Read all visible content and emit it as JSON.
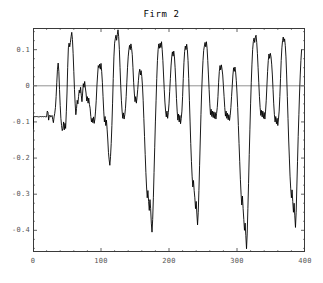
{
  "chart_data": {
    "type": "line",
    "title": "Firm 2",
    "xlabel": "",
    "ylabel": "",
    "xlim": [
      0,
      400
    ],
    "ylim": [
      -0.46,
      0.16
    ],
    "grid": false,
    "legend": null,
    "zero_line": 0,
    "line_color": "#000000",
    "frame_color": "#3a3a3a",
    "zero_line_color": "#777777",
    "tick_label_color": "#555555",
    "background": "#ffffff",
    "yticks": [
      0.1,
      0,
      -0.1,
      -0.2,
      -0.3,
      -0.4
    ],
    "ytick_labels": [
      "0.1",
      "0",
      "-0.1",
      "-0.2",
      "-0.3",
      "-0.4"
    ],
    "xticks": [
      0,
      100,
      200,
      300,
      400
    ],
    "xtick_labels": [
      "0",
      "100",
      "200",
      "300",
      "400"
    ],
    "n_points": 400,
    "series_name": "Firm 2",
    "summary": {
      "max": 0.152,
      "min": -0.451,
      "start_value": -0.12,
      "plateau_value": -0.085,
      "cycle_period": 36
    },
    "x": [
      0,
      1,
      2,
      3,
      4,
      5,
      6,
      7,
      8,
      9,
      10,
      11,
      12,
      13,
      14,
      15,
      16,
      17,
      18,
      19,
      20,
      21,
      22,
      23,
      24,
      25,
      26,
      27,
      28,
      29,
      30,
      31,
      32,
      33,
      34,
      35,
      36,
      37,
      38,
      39,
      40,
      41,
      42,
      43,
      44,
      45,
      46,
      47,
      48,
      49,
      50,
      51,
      52,
      53,
      54,
      55,
      56,
      57,
      58,
      59,
      60,
      61,
      62,
      63,
      64,
      65,
      66,
      67,
      68,
      69,
      70,
      71,
      72,
      73,
      74,
      75,
      76,
      77,
      78,
      79,
      80,
      81,
      82,
      83,
      84,
      85,
      86,
      87,
      88,
      89,
      90,
      91,
      92,
      93,
      94,
      95,
      96,
      97,
      98,
      99,
      100,
      101,
      102,
      103,
      104,
      105,
      106,
      107,
      108,
      109,
      110,
      111,
      112,
      113,
      114,
      115,
      116,
      117,
      118,
      119,
      120,
      121,
      122,
      123,
      124,
      125,
      126,
      127,
      128,
      129,
      130,
      131,
      132,
      133,
      134,
      135,
      136,
      137,
      138,
      139,
      140,
      141,
      142,
      143,
      144,
      145,
      146,
      147,
      148,
      149,
      150,
      151,
      152,
      153,
      154,
      155,
      156,
      157,
      158,
      159,
      160,
      161,
      162,
      163,
      164,
      165,
      166,
      167,
      168,
      169,
      170,
      171,
      172,
      173,
      174,
      175,
      176,
      177,
      178,
      179,
      180,
      181,
      182,
      183,
      184,
      185,
      186,
      187,
      188,
      189,
      190,
      191,
      192,
      193,
      194,
      195,
      196,
      197,
      198,
      199,
      200,
      201,
      202,
      203,
      204,
      205,
      206,
      207,
      208,
      209,
      210,
      211,
      212,
      213,
      214,
      215,
      216,
      217,
      218,
      219,
      220,
      221,
      222,
      223,
      224,
      225,
      226,
      227,
      228,
      229,
      230,
      231,
      232,
      233,
      234,
      235,
      236,
      237,
      238,
      239,
      240,
      241,
      242,
      243,
      244,
      245,
      246,
      247,
      248,
      249,
      250,
      251,
      252,
      253,
      254,
      255,
      256,
      257,
      258,
      259,
      260,
      261,
      262,
      263,
      264,
      265,
      266,
      267,
      268,
      269,
      270,
      271,
      272,
      273,
      274,
      275,
      276,
      277,
      278,
      279,
      280,
      281,
      282,
      283,
      284,
      285,
      286,
      287,
      288,
      289,
      290,
      291,
      292,
      293,
      294,
      295,
      296,
      297,
      298,
      299,
      300,
      301,
      302,
      303,
      304,
      305,
      306,
      307,
      308,
      309,
      310,
      311,
      312,
      313,
      314,
      315,
      316,
      317,
      318,
      319,
      320,
      321,
      322,
      323,
      324,
      325,
      326,
      327,
      328,
      329,
      330,
      331,
      332,
      333,
      334,
      335,
      336,
      337,
      338,
      339,
      340,
      341,
      342,
      343,
      344,
      345,
      346,
      347,
      348,
      349,
      350,
      351,
      352,
      353,
      354,
      355,
      356,
      357,
      358,
      359,
      360,
      361,
      362,
      363,
      364,
      365,
      366,
      367,
      368,
      369,
      370,
      371,
      372,
      373,
      374,
      375,
      376,
      377,
      378,
      379,
      380,
      381,
      382,
      383,
      384,
      385,
      386,
      387,
      388,
      389,
      390,
      391,
      392,
      393,
      394,
      395
    ],
    "y": [
      -0.12,
      -0.086,
      -0.085,
      -0.086,
      -0.085,
      -0.085,
      -0.086,
      -0.085,
      -0.086,
      -0.085,
      -0.086,
      -0.085,
      -0.085,
      -0.086,
      -0.085,
      -0.086,
      -0.085,
      -0.085,
      -0.086,
      -0.085,
      -0.086,
      -0.07,
      -0.073,
      -0.095,
      -0.083,
      -0.081,
      -0.086,
      -0.085,
      -0.082,
      -0.093,
      -0.102,
      -0.086,
      -0.076,
      -0.06,
      -0.03,
      0.01,
      0.046,
      0.063,
      0.04,
      -0.01,
      -0.055,
      -0.09,
      -0.11,
      -0.124,
      -0.118,
      -0.1,
      -0.122,
      -0.104,
      -0.118,
      -0.072,
      -0.02,
      0.05,
      0.105,
      0.118,
      0.108,
      0.12,
      0.136,
      0.148,
      0.128,
      0.09,
      0.04,
      -0.01,
      -0.05,
      -0.08,
      -0.063,
      -0.04,
      -0.05,
      -0.03,
      -0.012,
      -0.02,
      -0.004,
      -0.026,
      -0.044,
      -0.02,
      0.006,
      -0.004,
      0.012,
      -0.006,
      -0.02,
      -0.042,
      -0.03,
      -0.048,
      -0.034,
      -0.052,
      -0.062,
      -0.085,
      -0.1,
      -0.09,
      -0.102,
      -0.086,
      -0.104,
      -0.092,
      -0.07,
      -0.04,
      0.0,
      0.03,
      0.056,
      0.05,
      0.06,
      0.046,
      0.062,
      0.04,
      0.01,
      -0.03,
      -0.07,
      -0.1,
      -0.085,
      -0.11,
      -0.095,
      -0.12,
      -0.15,
      -0.185,
      -0.205,
      -0.22,
      -0.196,
      -0.16,
      -0.11,
      -0.05,
      0.02,
      0.08,
      0.118,
      0.13,
      0.14,
      0.126,
      0.142,
      0.155,
      0.136,
      0.1,
      0.05,
      0.0,
      -0.04,
      -0.07,
      -0.09,
      -0.075,
      -0.092,
      -0.08,
      -0.062,
      -0.03,
      0.01,
      0.05,
      0.08,
      0.1,
      0.112,
      0.1,
      0.116,
      0.104,
      0.086,
      0.05,
      0.01,
      -0.02,
      -0.044,
      -0.03,
      -0.048,
      -0.032,
      -0.01,
      0.014,
      0.036,
      0.046,
      0.03,
      0.042,
      0.026,
      0.0,
      -0.04,
      -0.09,
      -0.14,
      -0.19,
      -0.24,
      -0.28,
      -0.31,
      -0.29,
      -0.32,
      -0.345,
      -0.315,
      -0.34,
      -0.38,
      -0.405,
      -0.37,
      -0.31,
      -0.24,
      -0.17,
      -0.1,
      -0.04,
      0.02,
      0.07,
      0.1,
      0.116,
      0.104,
      0.118,
      0.106,
      0.122,
      0.1,
      0.07,
      0.03,
      -0.01,
      -0.045,
      -0.07,
      -0.086,
      -0.07,
      -0.09,
      -0.074,
      -0.05,
      -0.015,
      0.02,
      0.055,
      0.08,
      0.094,
      0.082,
      0.096,
      0.08,
      0.05,
      0.01,
      -0.035,
      -0.07,
      -0.095,
      -0.078,
      -0.1,
      -0.082,
      -0.105,
      -0.09,
      -0.07,
      -0.03,
      0.02,
      0.065,
      0.095,
      0.11,
      0.1,
      0.115,
      0.1,
      0.07,
      0.02,
      -0.04,
      -0.1,
      -0.16,
      -0.21,
      -0.25,
      -0.28,
      -0.262,
      -0.29,
      -0.31,
      -0.34,
      -0.32,
      -0.355,
      -0.385,
      -0.35,
      -0.29,
      -0.22,
      -0.15,
      -0.08,
      -0.02,
      0.03,
      0.07,
      0.098,
      0.11,
      0.12,
      0.108,
      0.122,
      0.104,
      0.07,
      0.03,
      -0.01,
      -0.05,
      -0.08,
      -0.065,
      -0.085,
      -0.07,
      -0.088,
      -0.072,
      -0.09,
      -0.074,
      -0.092,
      -0.076,
      -0.06,
      -0.03,
      0.01,
      0.04,
      0.056,
      0.044,
      0.058,
      0.046,
      0.03,
      0.0,
      -0.03,
      -0.06,
      -0.084,
      -0.07,
      -0.09,
      -0.076,
      -0.094,
      -0.08,
      -0.096,
      -0.082,
      -0.06,
      -0.03,
      0.0,
      0.03,
      0.05,
      0.04,
      0.052,
      0.038,
      0.014,
      -0.02,
      -0.06,
      -0.11,
      -0.16,
      -0.21,
      -0.26,
      -0.3,
      -0.33,
      -0.305,
      -0.34,
      -0.37,
      -0.4,
      -0.38,
      -0.415,
      -0.451,
      -0.41,
      -0.34,
      -0.27,
      -0.19,
      -0.12,
      -0.05,
      0.01,
      0.06,
      0.1,
      0.122,
      0.132,
      0.12,
      0.135,
      0.14,
      0.12,
      0.09,
      0.05,
      0.01,
      -0.03,
      -0.06,
      -0.082,
      -0.068,
      -0.086,
      -0.07,
      -0.09,
      -0.074,
      -0.092,
      -0.07,
      -0.04,
      0.0,
      0.04,
      0.07,
      0.088,
      0.076,
      0.09,
      0.08,
      0.06,
      0.03,
      -0.01,
      -0.05,
      -0.08,
      -0.1,
      -0.085,
      -0.105,
      -0.09,
      -0.11,
      -0.092,
      -0.07,
      -0.03,
      0.02,
      0.07,
      0.105,
      0.125,
      0.135,
      0.122,
      0.13,
      0.112,
      0.08,
      0.03,
      -0.03,
      -0.09,
      -0.15,
      -0.2,
      -0.25,
      -0.285,
      -0.31,
      -0.288,
      -0.32,
      -0.35,
      -0.325,
      -0.36,
      -0.392,
      -0.35,
      -0.28,
      -0.21,
      -0.14,
      -0.08,
      -0.02,
      0.03,
      0.07,
      0.1,
      0.125,
      0.14,
      0.148,
      0.13,
      0.11,
      0.08,
      0.04,
      0.0,
      -0.04,
      -0.075,
      -0.1,
      -0.085,
      -0.108,
      -0.09,
      -0.112,
      -0.095,
      -0.115,
      -0.128,
      -0.11,
      -0.13,
      -0.145,
      -0.12,
      -0.08,
      -0.04,
      0.0,
      0.03,
      0.055,
      0.066,
      0.058,
      0.064,
      0.05,
      0.02,
      -0.02,
      -0.06,
      -0.095,
      -0.115,
      -0.1,
      -0.12,
      -0.105,
      -0.125,
      -0.108,
      -0.128,
      -0.112,
      -0.09,
      -0.06,
      -0.02,
      0.02,
      0.05,
      0.066,
      0.058,
      0.068,
      0.05
    ]
  }
}
